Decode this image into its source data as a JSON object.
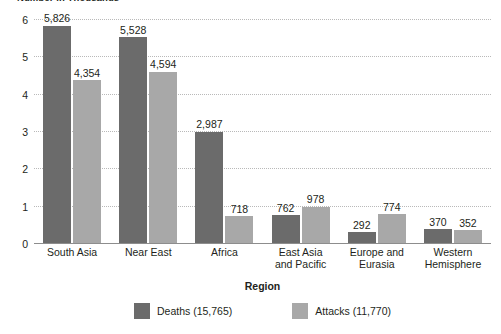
{
  "chart_data": {
    "type": "bar",
    "title": "Number in Thousands",
    "xlabel": "Region",
    "ylabel": "",
    "ylim": [
      0,
      6
    ],
    "yticks": [
      "0",
      "1",
      "2",
      "3",
      "4",
      "5",
      "6"
    ],
    "grid": true,
    "legend_position": "bottom",
    "categories": [
      "South Asia",
      "Near East",
      "Africa",
      "East Asia and Pacific",
      "Europe and Eurasia",
      "Western Hemisphere"
    ],
    "category_lines": [
      [
        "South Asia"
      ],
      [
        "Near East"
      ],
      [
        "Africa"
      ],
      [
        "East Asia",
        "and Pacific"
      ],
      [
        "Europe and",
        "Eurasia"
      ],
      [
        "Western",
        "Hemisphere"
      ]
    ],
    "series": [
      {
        "name": "Deaths",
        "legend_label": "Deaths (15,765)",
        "total": 15765,
        "color": "#6b6b6b",
        "values": [
          5826,
          5528,
          2987,
          762,
          292,
          370
        ],
        "value_labels": [
          "5,826",
          "5,528",
          "2,987",
          "762",
          "292",
          "370"
        ]
      },
      {
        "name": "Attacks",
        "legend_label": "Attacks (11,770)",
        "total": 11770,
        "color": "#a8a8a8",
        "values": [
          4354,
          4594,
          718,
          978,
          774,
          352
        ],
        "value_labels": [
          "4,354",
          "4,594",
          "718",
          "978",
          "774",
          "352"
        ]
      }
    ]
  }
}
